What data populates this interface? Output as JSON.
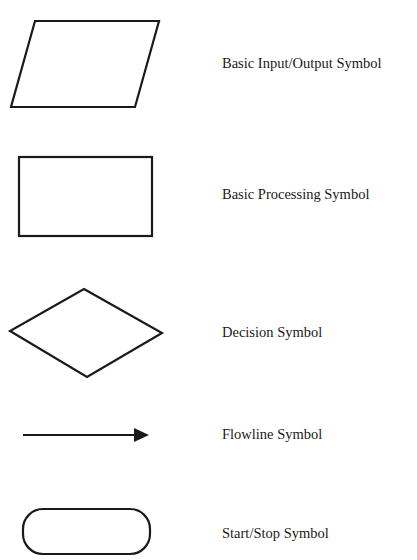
{
  "legend": {
    "title": "Flowchart Symbols",
    "items": [
      {
        "id": "io",
        "shape": "parallelogram",
        "label": "Basic Input/Output Symbol"
      },
      {
        "id": "process",
        "shape": "rectangle",
        "label": "Basic Processing Symbol"
      },
      {
        "id": "decision",
        "shape": "diamond",
        "label": "Decision Symbol"
      },
      {
        "id": "flowline",
        "shape": "arrow",
        "label": "Flowline Symbol"
      },
      {
        "id": "terminal",
        "shape": "rounded-rectangle",
        "label": "Start/Stop Symbol"
      }
    ]
  },
  "colors": {
    "stroke": "#1a1a1a",
    "background": "#ffffff",
    "text": "#1a1a1a"
  }
}
